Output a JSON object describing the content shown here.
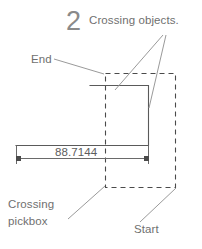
{
  "figure": {
    "title": "Crossing objects.",
    "step_number": "2",
    "colors": {
      "text": "#6f6f6f",
      "step_number": "#8a8a8a",
      "geometry_line": "#5a5a5a",
      "dashed_pickbox": "#4a4a4a",
      "leader_line": "#9a9a9a",
      "dimension_line": "#6a6a6a",
      "background": "#ffffff"
    }
  },
  "labels": {
    "end": "End",
    "crossing_objects": "Crossing objects.",
    "crossing_pickbox_line1": "Crossing",
    "crossing_pickbox_line2": "pickbox",
    "start": "Start"
  },
  "dimension": {
    "value": "88.7144"
  },
  "icons": {
    "arrow_tick": "dimension-arrow-tick"
  }
}
